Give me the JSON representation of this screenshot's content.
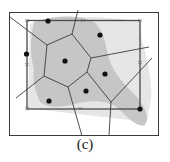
{
  "figure": {
    "caption": "(c)",
    "type": "voronoi-diagram",
    "colors": {
      "frame": "#3a3a3a",
      "inner_rect": "#4a4a4a",
      "edge": "#3c3c3c",
      "site": "#111111",
      "blob_light": "#e4e4e4",
      "blob_dark": "#c4c4c4"
    },
    "site_count": 8
  }
}
